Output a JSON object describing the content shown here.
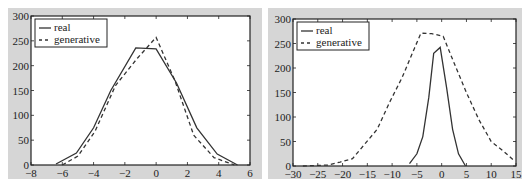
{
  "chart_data": [
    {
      "type": "line",
      "title": "",
      "xlabel": "",
      "ylabel": "",
      "xlim": [
        -8,
        6
      ],
      "ylim": [
        0,
        300
      ],
      "xticks": [
        -8,
        -6,
        -4,
        -2,
        0,
        2,
        4,
        6
      ],
      "yticks": [
        0,
        50,
        100,
        150,
        200,
        250,
        300
      ],
      "grid": false,
      "legend_position": "upper left",
      "series": [
        {
          "name": "real",
          "style": "solid",
          "x": [
            -6.4,
            -5.1,
            -4.0,
            -2.9,
            -1.3,
            0.0,
            1.3,
            2.6,
            3.9,
            5.2
          ],
          "y": [
            2,
            24,
            75,
            150,
            236,
            234,
            165,
            75,
            22,
            0
          ]
        },
        {
          "name": "generative",
          "style": "dashed",
          "x": [
            -6.0,
            -5.0,
            -3.9,
            -2.6,
            -1.2,
            0.0,
            1.2,
            2.4,
            3.7,
            5.0
          ],
          "y": [
            0,
            18,
            68,
            160,
            215,
            257,
            170,
            60,
            15,
            0
          ]
        }
      ]
    },
    {
      "type": "line",
      "title": "",
      "xlabel": "",
      "ylabel": "",
      "xlim": [
        -30,
        15
      ],
      "ylim": [
        0,
        300
      ],
      "xticks": [
        -30,
        -25,
        -20,
        -15,
        -10,
        -5,
        0,
        5,
        10,
        15
      ],
      "yticks": [
        0,
        50,
        100,
        150,
        200,
        250,
        300
      ],
      "grid": false,
      "legend_position": "upper left",
      "series": [
        {
          "name": "real",
          "style": "solid",
          "x": [
            -6.5,
            -5.0,
            -3.8,
            -2.6,
            -1.6,
            -0.3,
            1.0,
            2.2,
            3.4,
            4.8
          ],
          "y": [
            5,
            25,
            60,
            140,
            230,
            242,
            160,
            75,
            25,
            0
          ]
        },
        {
          "name": "generative",
          "style": "dashed",
          "x": [
            -28,
            -25.5,
            -23,
            -20.5,
            -18,
            -15.5,
            -13,
            -10.5,
            -8,
            -5.5,
            -4.2,
            -2,
            0.3,
            2.5,
            5,
            7.5,
            10,
            12.5,
            14.5
          ],
          "y": [
            0,
            1,
            2,
            8,
            15,
            45,
            75,
            130,
            180,
            240,
            271,
            270,
            265,
            210,
            150,
            95,
            50,
            30,
            12
          ]
        }
      ]
    }
  ],
  "legend": {
    "real_label": "real",
    "generative_label": "generative"
  },
  "colors": {
    "frame_bg": "#d6d6d6",
    "plot_bg": "#ffffff",
    "line": "#333333"
  }
}
